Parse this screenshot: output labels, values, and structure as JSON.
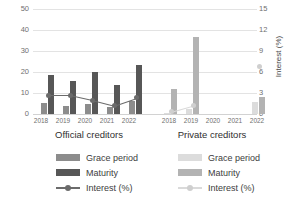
{
  "chart_data": {
    "type": "bar",
    "title": "",
    "ylabel": "Years",
    "ylabel_secondary": "Interest (%)",
    "xlabel": "",
    "ylim": [
      0,
      50
    ],
    "ylim_secondary": [
      0,
      15
    ],
    "yticks": [
      "0",
      "10",
      "20",
      "30",
      "40",
      "50"
    ],
    "yticks_secondary": [
      "0",
      "3",
      "6",
      "9",
      "12",
      "15"
    ],
    "grid": true,
    "legend_position": "bottom",
    "groups": [
      {
        "name": "Official creditors",
        "categories": [
          "2018",
          "2019",
          "2020",
          "2021",
          "2022"
        ],
        "series": [
          {
            "name": "Grace period",
            "axis": "left",
            "color": "#8c8c8c",
            "values": [
              5.3,
              3.8,
              4.6,
              3.2,
              6.3
            ]
          },
          {
            "name": "Maturity",
            "axis": "left",
            "color": "#575757",
            "values": [
              18.6,
              15.7,
              20.2,
              13.8,
              23.3
            ]
          },
          {
            "name": "Interest (%)",
            "axis": "right",
            "color": "#6b6b6b",
            "type": "line",
            "values": [
              2.7,
              2.7,
              2.0,
              1.2,
              2.3
            ]
          }
        ]
      },
      {
        "name": "Private creditors",
        "categories": [
          "2018",
          "2019",
          "2020",
          "2021",
          "2022"
        ],
        "series": [
          {
            "name": "Grace period",
            "axis": "left",
            "color": "#dcdcdc",
            "values": [
              0.3,
              2.5,
              0,
              0,
              5.5
            ]
          },
          {
            "name": "Maturity",
            "axis": "left",
            "color": "#b3b3b3",
            "values": [
              11.8,
              36.5,
              0,
              0,
              8.0
            ]
          },
          {
            "name": "Interest (%)",
            "axis": "right",
            "color": "#cfcfcf",
            "type": "line",
            "values": [
              0.3,
              1.2,
              null,
              null,
              6.8
            ]
          }
        ]
      }
    ]
  },
  "axes": {
    "left_title": "Years",
    "right_title": "Interest (%)",
    "left_ticks": [
      "50",
      "40",
      "30",
      "20",
      "10",
      "0"
    ],
    "right_ticks": [
      "15",
      "12",
      "9",
      "6",
      "3",
      "0"
    ]
  },
  "groups": {
    "official": {
      "title": "Official creditors",
      "years": [
        "2018",
        "2019",
        "2020",
        "2021",
        "2022"
      ]
    },
    "private": {
      "title": "Private creditors",
      "years": [
        "2018",
        "2019",
        "2020",
        "2021",
        "2022"
      ]
    }
  },
  "legend": {
    "official": [
      {
        "label": "Grace period"
      },
      {
        "label": "Maturity"
      },
      {
        "label": "Interest (%)"
      }
    ],
    "private": [
      {
        "label": "Grace period"
      },
      {
        "label": "Maturity"
      },
      {
        "label": "Interest (%)"
      }
    ]
  },
  "colors": {
    "grace_official": "#8c8c8c",
    "maturity_official": "#575757",
    "interest_official": "#6b6b6b",
    "grace_private": "#dcdcdc",
    "maturity_private": "#b3b3b3",
    "interest_private": "#cfcfcf",
    "grid": "#e3e3e3"
  }
}
